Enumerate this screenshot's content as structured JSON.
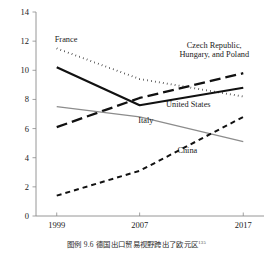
{
  "caption": {
    "text": "图例 9.6  德国出口贸易视野跨出了欧元区",
    "superscript": "135"
  },
  "chart_data": {
    "type": "line",
    "title": "",
    "xlabel": "",
    "ylabel": "",
    "x": [
      1999,
      2007,
      2017
    ],
    "xtick_labels": [
      "1999",
      "2007",
      "2017"
    ],
    "ylim": [
      0,
      14
    ],
    "ytick_values": [
      0,
      2,
      4,
      6,
      8,
      10,
      12,
      14
    ],
    "ytick_labels": [
      "0",
      "2",
      "4",
      "6",
      "8",
      "10",
      "12",
      "14"
    ],
    "grid": false,
    "legend": "inline-annotations",
    "series": [
      {
        "name": "France",
        "label": "France",
        "style": "dotted",
        "color": "#111111",
        "values": [
          11.5,
          9.4,
          8.2
        ],
        "label_x": 1999.9,
        "label_y": 11.95
      },
      {
        "name": "United States",
        "label": "United States",
        "style": "solid-thick",
        "color": "#111111",
        "values": [
          10.2,
          7.6,
          8.8
        ],
        "label_x": 2011.7,
        "label_y": 7.45
      },
      {
        "name": "Czech Republic, Hungary, and Poland",
        "label": "Czech Republic,\nHungary, and Poland",
        "label_line1": "Czech Republic,",
        "label_line2": "Hungary, and Poland",
        "style": "long-dash",
        "color": "#111111",
        "values": [
          6.1,
          8.1,
          9.8
        ],
        "label_x": 2014.2,
        "label_y": 11.55
      },
      {
        "name": "Italy",
        "label": "Italy",
        "style": "solid-thin-gray",
        "color": "#8c8c8c",
        "values": [
          7.5,
          6.8,
          5.1
        ],
        "label_x": 2007.6,
        "label_y": 6.35
      },
      {
        "name": "China",
        "label": "China",
        "style": "dashed",
        "color": "#111111",
        "values": [
          1.4,
          3.1,
          6.8
        ],
        "label_x": 2011.6,
        "label_y": 4.35
      }
    ]
  }
}
